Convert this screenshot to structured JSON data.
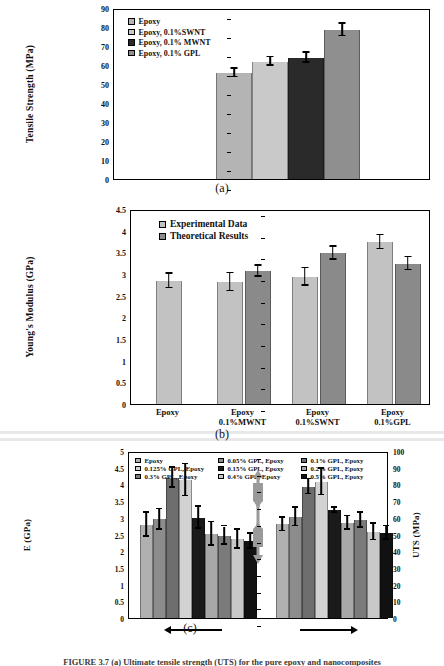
{
  "figure": {
    "caption": "FIGURE 3.7   (a) Ultimate tensile strength (UTS) for the pure epoxy and nanocomposites",
    "panel_labels": {
      "a": "(a)",
      "b": "(b)",
      "c": "(c)"
    }
  },
  "chart_data": [
    {
      "id": "a",
      "type": "bar",
      "title": "",
      "xlabel": "",
      "ylabel": "Tensile Strength (MPa)",
      "ylim": [
        0,
        90
      ],
      "yticks": [
        0,
        10,
        20,
        30,
        40,
        50,
        60,
        70,
        80,
        90
      ],
      "grid": false,
      "legend_position": "top-left",
      "categories": [
        "Epoxy",
        "Epoxy, 0.1%SWNT",
        "Epoxy, 0.1% MWNT",
        "Epoxy, 0.1% GPL"
      ],
      "values": [
        55.8,
        61.8,
        63.9,
        78.4
      ],
      "errors": [
        2.2,
        2.2,
        2.6,
        3.3
      ],
      "colors": [
        "#b4b4b4",
        "#c9c9c9",
        "#2a2a2a",
        "#8f8f8f"
      ],
      "legend": [
        {
          "label": "Epoxy",
          "color": "#b4b4b4"
        },
        {
          "label": "Epoxy, 0.1%SWNT",
          "color": "#c9c9c9"
        },
        {
          "label": "Epoxy, 0.1% MWNT",
          "color": "#2a2a2a"
        },
        {
          "label": "Epoxy, 0.1% GPL",
          "color": "#8f8f8f"
        }
      ]
    },
    {
      "id": "b",
      "type": "bar",
      "title": "",
      "xlabel": "",
      "ylabel": "Young's Modulus (GPa)",
      "ylim": [
        0,
        4.5
      ],
      "yticks": [
        0,
        0.5,
        1,
        1.5,
        2,
        2.5,
        3,
        3.5,
        4,
        4.5
      ],
      "grid": false,
      "legend_position": "top-left",
      "categories": [
        "Epoxy",
        "Epoxy 0.1%MWNT",
        "Epoxy 0.1%SWNT",
        "Epoxy 0.1%GPL"
      ],
      "category_lines": [
        [
          "Epoxy",
          ""
        ],
        [
          "Epoxy",
          "0.1%MWNT"
        ],
        [
          "Epoxy",
          "0.1%SWNT"
        ],
        [
          "Epoxy",
          "0.1%GPL"
        ]
      ],
      "series": [
        {
          "name": "Experimental Data",
          "color": "#c2c2c2",
          "values": [
            2.84,
            2.81,
            2.93,
            3.73
          ],
          "errors": [
            0.17,
            0.21,
            0.2,
            0.16
          ]
        },
        {
          "name": "Theoretical Results",
          "color": "#8a8a8a",
          "values": [
            null,
            3.06,
            3.48,
            3.24
          ],
          "errors": [
            null,
            0.13,
            0.15,
            0.15
          ]
        }
      ]
    },
    {
      "id": "c",
      "type": "bar",
      "title": "",
      "xlabel": "",
      "ylabel": "E (GPa)",
      "ylabel_right": "UTS (MPa)",
      "ylim": [
        0,
        5
      ],
      "yticks": [
        0,
        0.5,
        1,
        1.5,
        2,
        2.5,
        3,
        3.5,
        4,
        4.5,
        5
      ],
      "ylim_right": [
        0,
        100
      ],
      "yticks_right": [
        0,
        10,
        20,
        30,
        40,
        50,
        60,
        70,
        80,
        90,
        100
      ],
      "grid": false,
      "legend_position": "top",
      "annotation_left_arrow": "left-arrow",
      "annotation_right_arrow": "right-arrow",
      "annotation_specimen": "dogbone-tensile-specimen",
      "categories": [
        "Epoxy",
        "0.05% GPL, Epoxy",
        "0.1% GPL, Epoxy",
        "0.125% GPL, Epoxy",
        "0.15% GPL, Epoxy",
        "0.2% GPL, Epoxy",
        "0.3% GPL, Epoxy",
        "0.4% GPL, Epoxy",
        "0.5% GPL, Epoxy"
      ],
      "legend": [
        {
          "label": "Epoxy",
          "color": "#b0b0b0"
        },
        {
          "label": "0.05% GPL, Epoxy",
          "color": "#8c8c8c"
        },
        {
          "label": "0.1% GPL, Epoxy",
          "color": "#6e6e6e"
        },
        {
          "label": "0.125% GPL, Epoxy",
          "color": "#d2d2d2"
        },
        {
          "label": "0.15% GPL, Epoxy",
          "color": "#1a1a1a"
        },
        {
          "label": "0.2% GPL, Epoxy",
          "color": "#a8a8a8"
        },
        {
          "label": "0.3% GPL, Epoxy",
          "color": "#7a7a7a"
        },
        {
          "label": "0.4% GPL, Epoxy",
          "color": "#c8c8c8"
        },
        {
          "label": "0.5% GPL, Epoxy",
          "color": "#111111"
        }
      ],
      "series": [
        {
          "name": "E (GPa)",
          "axis": "left",
          "values": [
            2.79,
            2.95,
            4.19,
            4.12,
            3.0,
            2.51,
            2.47,
            2.36,
            2.3
          ],
          "errors": [
            0.36,
            0.31,
            0.3,
            0.48,
            0.33,
            0.35,
            0.27,
            0.29,
            0.22
          ]
        },
        {
          "name": "UTS (MPa)",
          "axis": "right",
          "values": [
            56.0,
            60.5,
            78.5,
            81.5,
            64.5,
            57.0,
            58.5,
            51.5,
            51.0
          ],
          "errors": [
            4.0,
            5.5,
            4.5,
            8.0,
            1.5,
            4.0,
            4.5,
            5.0,
            4.0
          ]
        }
      ]
    }
  ]
}
